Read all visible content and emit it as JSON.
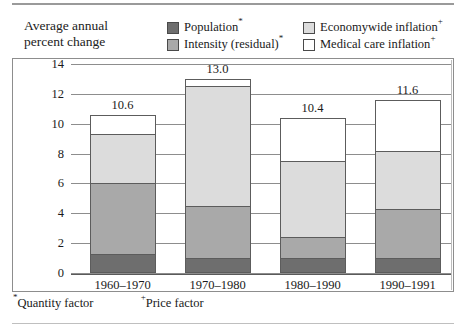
{
  "header": {
    "title_line1": "Average annual",
    "title_line2": "percent change"
  },
  "legend": {
    "items": [
      {
        "label": "Population",
        "marker": "*",
        "color": "#6e6e6e",
        "swatch": "pop"
      },
      {
        "label": "Intensity (residual)",
        "marker": "*",
        "color": "#a9a9a9",
        "swatch": "int"
      },
      {
        "label": "Economywide inflation",
        "marker": "+",
        "color": "#dcdcdc",
        "swatch": "eco"
      },
      {
        "label": "Medical care inflation",
        "marker": "+",
        "color": "#ffffff",
        "swatch": "med"
      }
    ]
  },
  "footnotes": {
    "quantity": "Quantity factor",
    "quantity_marker": "*",
    "price": "Price factor",
    "price_marker": "+"
  },
  "axis": {
    "ticks": [
      "14",
      "12",
      "10",
      "8",
      "6",
      "4",
      "2",
      "0"
    ]
  },
  "chart_data": {
    "type": "bar",
    "title": "Average annual percent change",
    "xlabel": "",
    "ylabel": "Average annual percent change",
    "ylim": [
      0,
      14
    ],
    "ytick_step": 2,
    "grid": true,
    "stacked": true,
    "legend_position": "top",
    "categories": [
      "1960–1970",
      "1970–1980",
      "1980–1990",
      "1990–1991"
    ],
    "series": [
      {
        "name": "Population*",
        "color": "#6e6e6e",
        "values": [
          1.3,
          1.0,
          1.0,
          1.0
        ]
      },
      {
        "name": "Intensity (residual)*",
        "color": "#a9a9a9",
        "values": [
          4.7,
          3.5,
          1.4,
          3.3
        ]
      },
      {
        "name": "Economywide inflation+",
        "color": "#dcdcdc",
        "values": [
          3.3,
          8.0,
          5.1,
          3.9
        ]
      },
      {
        "name": "Medical care inflation+",
        "color": "#ffffff",
        "values": [
          1.3,
          0.5,
          2.9,
          3.4
        ]
      }
    ],
    "totals": [
      "10.6",
      "13.0",
      "10.4",
      "11.6"
    ],
    "total_values": [
      10.6,
      13.0,
      10.4,
      11.6
    ]
  }
}
